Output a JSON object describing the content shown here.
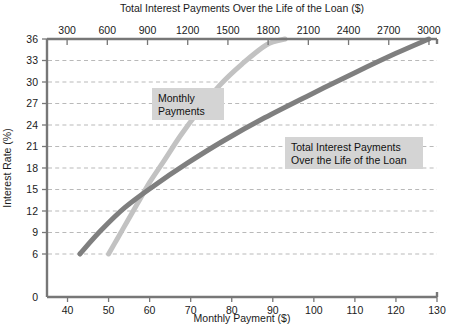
{
  "chart_data": {
    "type": "line",
    "title": "",
    "top_axis_label": "Total Interest Payments Over the Life of the Loan ($)",
    "xlabel": "Monthly Payment ($)",
    "ylabel": "Interest Rate (%)",
    "grid": "horizontal-dashed",
    "legend": "inline-annotations",
    "xlim": [
      35,
      130
    ],
    "ylim": [
      0,
      36
    ],
    "top_xlim": [
      150,
      3060
    ],
    "y_ticks": [
      0,
      6,
      9,
      12,
      15,
      18,
      21,
      24,
      27,
      30,
      33,
      36
    ],
    "y_tick_labels": [
      "0",
      "6",
      "9",
      "12",
      "15",
      "18",
      "21",
      "24",
      "27",
      "30",
      "33",
      "36"
    ],
    "x_ticks": [
      40,
      50,
      60,
      70,
      80,
      90,
      100,
      110,
      120,
      130
    ],
    "x_tick_labels": [
      "40",
      "50",
      "60",
      "70",
      "80",
      "90",
      "100",
      "110",
      "120",
      "130"
    ],
    "top_x_ticks": [
      300,
      600,
      900,
      1200,
      1500,
      1800,
      2100,
      2400,
      2700,
      3000
    ],
    "top_x_tick_labels": [
      "300",
      "600",
      "900",
      "1200",
      "1500",
      "1800",
      "2100",
      "2400",
      "2700",
      "3000"
    ],
    "series": [
      {
        "name": "Monthly Payments",
        "color": "#c2c2c2",
        "axis": "bottom",
        "x": [
          50.0,
          52.0,
          54.5,
          57.0,
          60.0,
          63.5,
          67.5,
          72.0,
          77.0,
          82.5,
          88.5,
          93.0
        ],
        "values": [
          6.0,
          8.0,
          10.5,
          13.0,
          16.0,
          19.0,
          22.5,
          26.0,
          29.5,
          32.5,
          35.2,
          36.0
        ]
      },
      {
        "name": "Total Interest Payments Over the Life of the Loan",
        "color": "#7f7f7f",
        "axis": "top",
        "x": [
          43.0,
          48.0,
          54.0,
          61.0,
          69.0,
          78.0,
          88.0,
          99.0,
          110.0,
          120.0,
          128.0
        ],
        "values": [
          6.0,
          9.2,
          12.5,
          15.5,
          18.6,
          21.8,
          25.0,
          28.2,
          31.3,
          34.0,
          36.0
        ]
      }
    ],
    "annotations": [
      {
        "name": "monthly-payments-label",
        "lines": [
          "Monthly",
          "Payments"
        ],
        "x_px": 152,
        "y_px": 88,
        "width_px": 72,
        "height_px": 32
      },
      {
        "name": "total-interest-label",
        "lines": [
          "Total Interest Payments",
          "Over the Life of the Loan"
        ],
        "x_px": 285,
        "y_px": 137,
        "width_px": 138,
        "height_px": 32
      }
    ]
  }
}
